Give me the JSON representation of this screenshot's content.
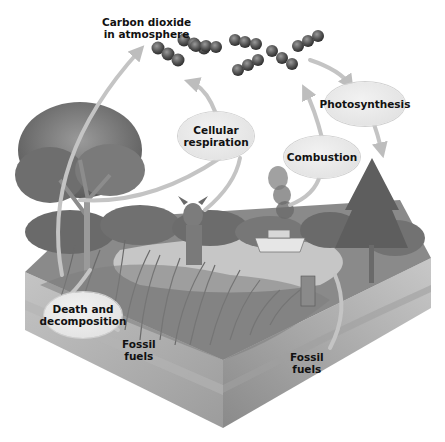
{
  "labels": {
    "co2": [
      "Carbon dioxide",
      "in atmosphere"
    ],
    "photosynthesis": "Photosynthesis",
    "cellular_respiration": [
      "Cellular",
      "respiration"
    ],
    "combustion": "Combustion",
    "death_decomposition": [
      "Death and",
      "decomposition"
    ],
    "fossil_fuels_left": [
      "Fossil",
      "fuels"
    ],
    "fossil_fuels_right": [
      "Fossil",
      "fuels"
    ]
  },
  "illustration": {
    "elements": [
      "CO2 molecules",
      "deciduous tree",
      "pine tree",
      "deer",
      "boat",
      "smoke",
      "lake",
      "reeds",
      "tree stump",
      "soil block"
    ]
  },
  "colors": {
    "background": "#ffffff",
    "bubble": "#e6e6e6",
    "arrow": "#c8c8c8",
    "soil": "#a8a8a8",
    "foliage": "#6e6e6e",
    "molecule": "#555555"
  }
}
